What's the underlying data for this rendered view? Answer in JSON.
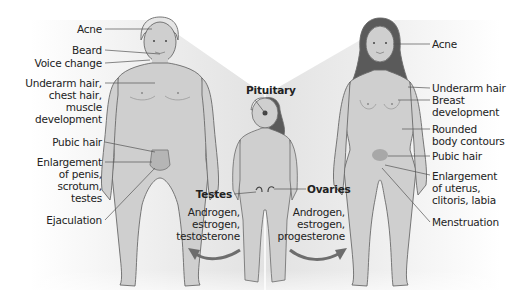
{
  "male": {
    "labels": [
      {
        "id": "acne",
        "text": "Acne"
      },
      {
        "id": "beard",
        "text": "Beard"
      },
      {
        "id": "voice",
        "text": "Voice change"
      },
      {
        "id": "underarm",
        "text": "Underarm hair,\nchest hair,\nmuscle\ndevelopment"
      },
      {
        "id": "pubic",
        "text": "Pubic hair"
      },
      {
        "id": "enlargement",
        "text": "Enlargement\nof penis,\nscrotum,\ntestes"
      },
      {
        "id": "ejaculation",
        "text": "Ejaculation"
      }
    ]
  },
  "female": {
    "labels": [
      {
        "id": "acne",
        "text": "Acne"
      },
      {
        "id": "underarm",
        "text": "Underarm hair"
      },
      {
        "id": "breast",
        "text": "Breast\ndevelopment"
      },
      {
        "id": "contours",
        "text": "Rounded\nbody contours"
      },
      {
        "id": "pubic",
        "text": "Pubic hair"
      },
      {
        "id": "enlargement",
        "text": "Enlargement\nof uterus,\nclitoris, labia"
      },
      {
        "id": "menstruation",
        "text": "Menstruation"
      }
    ]
  },
  "center": {
    "pituitary": "Pituitary",
    "testes": "Testes",
    "testes_hormones": "Androgen,\nestrogen,\ntestosterone",
    "ovaries": "Ovaries",
    "ovaries_hormones": "Androgen,\nestrogen,\nprogesterone"
  },
  "colors": {
    "skin": "#cfcfcf",
    "outline": "#6a6a6a",
    "hair_dark": "#5a5a5a",
    "shade": "#d9d9d9",
    "accent_region": "#a8a8a8",
    "arrow": "#6d6d6d",
    "text": "#222222"
  }
}
